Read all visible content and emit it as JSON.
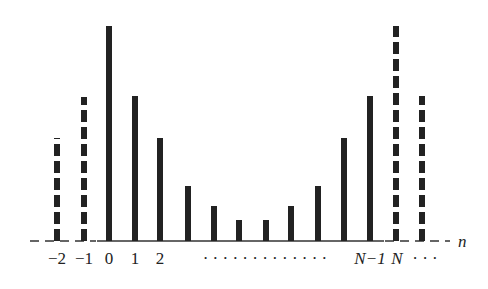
{
  "chart_data": {
    "type": "bar",
    "title": "",
    "xlabel": "n",
    "ylabel": "",
    "baseline_y": 241,
    "bars": [
      {
        "n": -2,
        "x": 57,
        "top": 138,
        "style": "dashed"
      },
      {
        "n": -1,
        "x": 84,
        "top": 97,
        "style": "dashed"
      },
      {
        "n": 0,
        "x": 109,
        "top": 26,
        "style": "solid"
      },
      {
        "n": 1,
        "x": 135,
        "top": 96,
        "style": "solid"
      },
      {
        "n": 2,
        "x": 160,
        "top": 138,
        "style": "solid"
      },
      {
        "n": 3,
        "x": 188,
        "top": 186,
        "style": "solid"
      },
      {
        "n": 4,
        "x": 214,
        "top": 206,
        "style": "solid"
      },
      {
        "n": 5,
        "x": 239,
        "top": 220,
        "style": "solid"
      },
      {
        "n": 6,
        "x": 266,
        "top": 220,
        "style": "solid"
      },
      {
        "n": 7,
        "x": 291,
        "top": 206,
        "style": "solid"
      },
      {
        "n": 8,
        "x": 318,
        "top": 186,
        "style": "solid"
      },
      {
        "n": 9,
        "x": 344,
        "top": 138,
        "style": "solid"
      },
      {
        "n": "N-1",
        "x": 370,
        "top": 96,
        "style": "solid"
      },
      {
        "n": "N",
        "x": 396,
        "top": 26,
        "style": "dashed"
      },
      {
        "n": "N+1",
        "x": 422,
        "top": 96,
        "style": "dashed"
      }
    ],
    "tick_labels": [
      {
        "text": "−2",
        "x": 57
      },
      {
        "text": "−1",
        "x": 84
      },
      {
        "text": "0",
        "x": 109
      },
      {
        "text": "1",
        "x": 135
      },
      {
        "text": "2",
        "x": 160
      },
      {
        "text": "· · · · · · · · · · · · ·",
        "x": 265
      },
      {
        "text": "N−1",
        "x": 370,
        "italic": true
      },
      {
        "text": "N",
        "x": 397,
        "italic": true
      },
      {
        "text": "· · ·",
        "x": 425
      }
    ],
    "axis_label": "n"
  }
}
